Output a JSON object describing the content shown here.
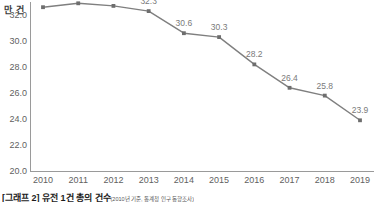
{
  "chart_data": {
    "type": "line",
    "title": "",
    "xlabel": "",
    "ylabel": "만 건",
    "unit_label": "만 건",
    "categories": [
      "2010",
      "2011",
      "2012",
      "2013",
      "2014",
      "2015",
      "2016",
      "2017",
      "2018",
      "2019"
    ],
    "values": [
      32.6,
      32.9,
      32.7,
      32.3,
      30.6,
      30.3,
      28.2,
      26.4,
      25.8,
      23.9
    ],
    "point_labels": [
      "32.6",
      "32.9",
      "32.7",
      "32.3",
      "30.6",
      "30.3",
      "28.2",
      "26.4",
      "25.8",
      "23.9"
    ],
    "ylim": [
      20.0,
      33.0
    ],
    "yticks": [
      20.0,
      22.0,
      24.0,
      26.0,
      28.0,
      30.0,
      32.0
    ],
    "ytick_labels": [
      "20.0",
      "22.0",
      "24.0",
      "26.0",
      "28.0",
      "30.0",
      "32.0"
    ],
    "grid": false,
    "legend": null,
    "series": [
      {
        "name": "",
        "values": [
          32.6,
          32.9,
          32.7,
          32.3,
          30.6,
          30.3,
          28.2,
          26.4,
          25.8,
          23.9
        ],
        "color": "#7f7f7f",
        "marker": "square"
      }
    ]
  },
  "colors": {
    "line": "#7f7f7f",
    "marker": "#6e6e6e",
    "axis": "#9a9a9a",
    "tick_text": "#5f5f5f",
    "label_text": "#7a7a7a",
    "caption_text": "#1c1c1c",
    "background": "#ffffff"
  },
  "caption": {
    "text": "[그래프 2] 유전 1건 총의 건수",
    "source": "(2010년 기준, 통계청 인구 동향조사)"
  }
}
